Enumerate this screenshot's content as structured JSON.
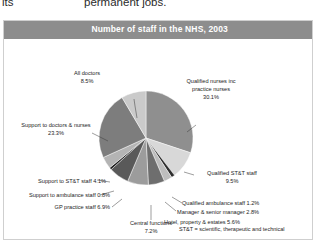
{
  "page_text": {
    "left_fragment": "its",
    "right_fragment": "permanent jobs."
  },
  "panel": {
    "title": "Number of staff in the NHS, 2003",
    "title_bar_color": "#8d8d8d",
    "footnote": "ST&T = scientific, therapeutic and technical"
  },
  "chart_data": {
    "type": "pie",
    "title": "Number of staff in the NHS, 2003",
    "xlabel": "",
    "ylabel": "",
    "legend_position": "callout-labels",
    "annotations": [
      "ST&T = scientific, therapeutic and technical"
    ],
    "categories": [
      "Qualified nurses inc practice nurses",
      "Qualified ST&T staff",
      "Qualified ambulance staff",
      "Manager & senior manager",
      "Hotel, property & estates",
      "Central functions",
      "GP practice staff",
      "Support to ambulance staff",
      "Support to ST&T staff",
      "Support to doctors & nurses",
      "All doctors"
    ],
    "values": [
      30.1,
      9.5,
      1.2,
      2.8,
      5.6,
      7.2,
      6.9,
      0.8,
      4.1,
      23.3,
      8.5
    ],
    "value_suffix": "%",
    "colors": [
      "#8f8f8f",
      "#d8d8d8",
      "#2e2e2e",
      "#bdbdbd",
      "#6e6e6e",
      "#9c9c9c",
      "#595959",
      "#1f1f1f",
      "#b4b4b4",
      "#7d7d7d",
      "#cacaca"
    ],
    "slices": [
      {
        "label": "Qualified nurses inc practice nurses",
        "value": "30.1%"
      },
      {
        "label": "Qualified ST&T staff",
        "value": "9.5%"
      },
      {
        "label": "Qualified ambulance staff",
        "value": "1.2%"
      },
      {
        "label": "Manager & senior manager",
        "value": "2.8%"
      },
      {
        "label": "Hotel, property & estates",
        "value": "5.6%"
      },
      {
        "label": "Central functions",
        "value": "7.2%"
      },
      {
        "label": "GP practice staff",
        "value": "6.9%"
      },
      {
        "label": "Support to ambulance staff",
        "value": "0.8%"
      },
      {
        "label": "Support to ST&T staff",
        "value": "4.1%"
      },
      {
        "label": "Support to doctors & nurses",
        "value": "23.3%"
      },
      {
        "label": "All doctors",
        "value": "8.5%"
      }
    ]
  },
  "labels": {
    "all_doctors_l1": "All doctors",
    "all_doctors_l2": "8.5%",
    "nurses_l1": "Qualified nurses inc",
    "nurses_l2": "practice nurses",
    "nurses_l3": "30.1%",
    "stt_l1": "Qualified ST&T staff",
    "stt_l2": "9.5%",
    "amb_qual": "Qualified ambulance staff 1.2%",
    "manager": "Manager & senior manager 2.8%",
    "hotel": "Hotel, property & estates 5.6%",
    "central_l1": "Central functions",
    "central_l2": "7.2%",
    "gp": "GP practice staff 6.9%",
    "sup_amb": "Support to ambulance staff 0.8%",
    "sup_stt": "Support to ST&T staff 4.1%",
    "sup_docs_l1": "Support to doctors & nurses",
    "sup_docs_l2": "23.3%"
  }
}
